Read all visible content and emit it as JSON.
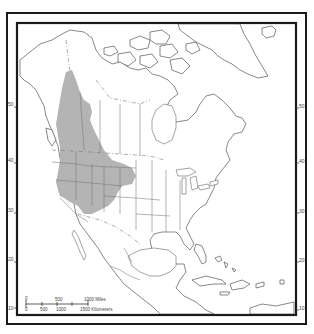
{
  "map": {
    "subject": "North America species range map",
    "range_label": "Shaded distribution range (western North America)",
    "colors": {
      "range_fill": "#b4b4b4",
      "frame": "#1a1a1a",
      "coastline": "#555555",
      "borders": "#777777",
      "background": "#ffffff"
    },
    "latitude_labels_left": [
      "50",
      "40",
      "30",
      "20",
      "10"
    ],
    "latitude_labels_right": [
      "50",
      "40",
      "30",
      "20",
      "10"
    ],
    "scale_bar": {
      "miles_labels": [
        "0",
        "500",
        "1000 Miles"
      ],
      "kilometers_labels": [
        "0",
        "500",
        "1000",
        "1500 Kilometers"
      ]
    },
    "range_regions": [
      "British Columbia interior",
      "Alberta (west)",
      "Washington",
      "Oregon (east)",
      "Idaho",
      "Montana",
      "Wyoming",
      "Nevada",
      "Utah",
      "Colorado",
      "California (northeast / Sierra)",
      "Northern Arizona / New Mexico"
    ]
  }
}
